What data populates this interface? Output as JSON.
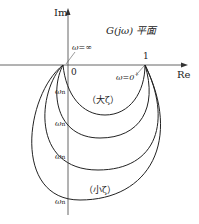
{
  "diagram": {
    "title": "G(jω) 平面",
    "axes": {
      "imag_label": "Im",
      "real_label": "Re",
      "origin_label": "0",
      "unit_label": "1"
    },
    "annotations": {
      "omega_infinity": "ω=∞",
      "omega_zero": "ω=0",
      "omega_zero_sup": "+",
      "omega_n": "ω",
      "omega_n_sub": "n",
      "large_zeta": "（大ζ）",
      "small_zeta": "（小ζ）"
    },
    "curves": [
      {
        "name": "large-zeta",
        "crosses_im_axis_y": 99
      },
      {
        "name": "mid-zeta-1",
        "crosses_im_axis_y": 130
      },
      {
        "name": "mid-zeta-2",
        "crosses_im_axis_y": 162
      },
      {
        "name": "small-zeta",
        "crosses_im_axis_y": 200
      }
    ],
    "colors": {
      "line": "#222222",
      "axis": "#555555",
      "background": "#ffffff"
    }
  }
}
